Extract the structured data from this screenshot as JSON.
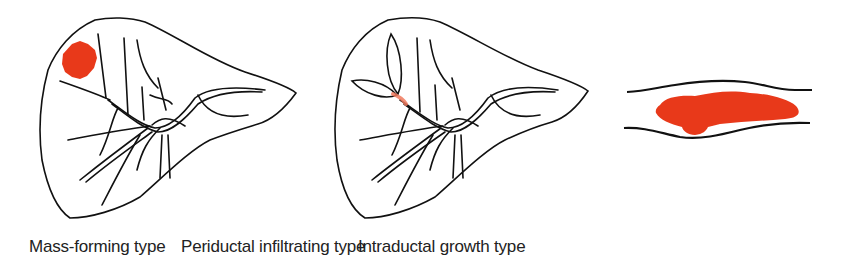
{
  "colors": {
    "tumor": "#e8391a",
    "outline": "#111111",
    "background": "#ffffff"
  },
  "panels": [
    {
      "id": "mass-forming",
      "caption": "Mass-forming type"
    },
    {
      "id": "periductal-infiltrating",
      "caption": "Periductal infiltrating type"
    },
    {
      "id": "intraductal-growth",
      "caption": "Intraductal growth type"
    }
  ]
}
